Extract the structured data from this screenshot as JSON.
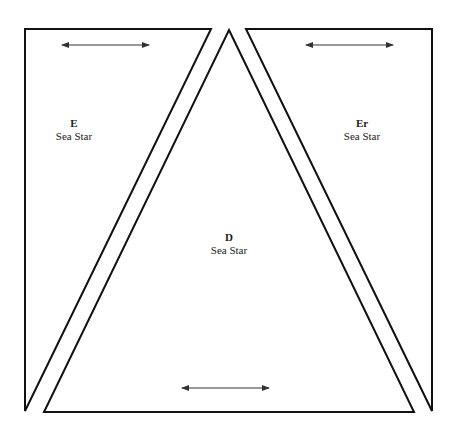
{
  "pieces": [
    {
      "id": "E",
      "letter": "E",
      "name": "Sea Star"
    },
    {
      "id": "D",
      "letter": "D",
      "name": "Sea Star"
    },
    {
      "id": "Er",
      "letter": "Er",
      "name": "Sea Star"
    }
  ],
  "colors": {
    "stroke": "#111111",
    "arrow": "#333333",
    "background": "#ffffff"
  }
}
